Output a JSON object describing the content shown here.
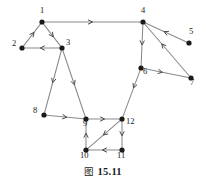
{
  "figure": {
    "caption_mark": "图",
    "caption_number": "15.11",
    "caption_full": "图 15.11"
  },
  "colors": {
    "node_fill": "#1a1a1a",
    "edge_stroke": "#8a8a8a",
    "arrow_stroke": "#4a4a4a",
    "label_color": "#1a1a1a",
    "background": "#ffffff"
  },
  "chart_data": {
    "type": "diagram",
    "diagram_kind": "directed-graph",
    "node_count": 12,
    "edge_count": 17,
    "nodes": [
      {
        "id": "1",
        "label": "1",
        "x": 42,
        "y": 22,
        "label_dx": -2,
        "label_dy": -12
      },
      {
        "id": "2",
        "label": "2",
        "x": 22,
        "y": 48,
        "label_dx": -10,
        "label_dy": -5
      },
      {
        "id": "3",
        "label": "3",
        "x": 62,
        "y": 48,
        "label_dx": 4,
        "label_dy": -6
      },
      {
        "id": "4",
        "label": "4",
        "x": 143,
        "y": 22,
        "label_dx": -2,
        "label_dy": -12
      },
      {
        "id": "5",
        "label": "5",
        "x": 189,
        "y": 43,
        "label_dx": 0,
        "label_dy": -12
      },
      {
        "id": "6",
        "label": "6",
        "x": 141,
        "y": 68,
        "label_dx": 2,
        "label_dy": 3
      },
      {
        "id": "7",
        "label": "7",
        "x": 191,
        "y": 78,
        "label_dx": -1,
        "label_dy": 4
      },
      {
        "id": "8",
        "label": "8",
        "x": 44,
        "y": 115,
        "label_dx": -11,
        "label_dy": -5
      },
      {
        "id": "9",
        "label": "9",
        "x": 86,
        "y": 119,
        "label_dx": -3,
        "label_dy": 4
      },
      {
        "id": "10",
        "label": "10",
        "x": 86,
        "y": 150,
        "label_dx": -6,
        "label_dy": 5
      },
      {
        "id": "11",
        "label": "11",
        "x": 122,
        "y": 150,
        "label_dx": -5,
        "label_dy": 5
      },
      {
        "id": "12",
        "label": "12",
        "x": 122,
        "y": 119,
        "label_dx": 4,
        "label_dy": 2
      }
    ],
    "edges": [
      {
        "from": "1",
        "to": "4",
        "directed": true,
        "arrow_t": 0.5
      },
      {
        "from": "2",
        "to": "1",
        "directed": true,
        "arrow_t": 0.62
      },
      {
        "from": "1",
        "to": "3",
        "directed": true,
        "arrow_t": 0.58
      },
      {
        "from": "3",
        "to": "2",
        "directed": true,
        "arrow_t": 0.55
      },
      {
        "from": "3",
        "to": "8",
        "directed": true,
        "arrow_t": 0.52
      },
      {
        "from": "3",
        "to": "9",
        "directed": true,
        "arrow_t": 0.52
      },
      {
        "from": "8",
        "to": "9",
        "directed": true,
        "arrow_t": 0.55
      },
      {
        "from": "9",
        "to": "12",
        "directed": true,
        "arrow_t": 0.52
      },
      {
        "from": "12",
        "to": "10",
        "directed": true,
        "arrow_t": 0.52
      },
      {
        "from": "10",
        "to": "9",
        "directed": true,
        "arrow_t": 0.55
      },
      {
        "from": "12",
        "to": "11",
        "directed": true,
        "arrow_t": 0.55
      },
      {
        "from": "11",
        "to": "10",
        "directed": true,
        "arrow_t": 0.55
      },
      {
        "from": "4",
        "to": "6",
        "directed": true,
        "arrow_t": 0.5
      },
      {
        "from": "6",
        "to": "7",
        "directed": true,
        "arrow_t": 0.42
      },
      {
        "from": "6",
        "to": "12",
        "directed": true,
        "arrow_t": 0.38
      },
      {
        "from": "5",
        "to": "4",
        "directed": true,
        "arrow_t": 0.55
      },
      {
        "from": "7",
        "to": "4",
        "directed": true,
        "arrow_t": 0.62
      }
    ]
  }
}
